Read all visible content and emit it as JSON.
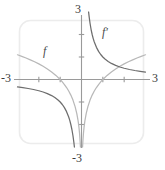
{
  "chart_data": {
    "type": "line",
    "title": "",
    "xlabel": "",
    "ylabel": "",
    "xlim": [
      -3,
      3
    ],
    "ylim": [
      -3,
      3
    ],
    "grid": false,
    "legend_position": "inline-annotation",
    "x_tick_labels": [
      "-3",
      "3"
    ],
    "y_tick_labels": [
      "3",
      "-3"
    ],
    "x_ticks": [
      -2,
      -1,
      1,
      2
    ],
    "y_ticks": [
      -2,
      -1,
      1,
      2
    ],
    "annotations": [
      {
        "text": "f",
        "x": -1.55,
        "y": 1.55
      },
      {
        "text": "f′",
        "x": 0.85,
        "y": 2.35
      }
    ],
    "series": [
      {
        "name": "f",
        "label": "f",
        "color": "#b8b8b8",
        "formula": "ln|x|",
        "points_negative": [
          [
            -3.0,
            1.099
          ],
          [
            -2.8,
            1.03
          ],
          [
            -2.6,
            0.956
          ],
          [
            -2.4,
            0.875
          ],
          [
            -2.2,
            0.788
          ],
          [
            -2.0,
            0.693
          ],
          [
            -1.8,
            0.588
          ],
          [
            -1.6,
            0.47
          ],
          [
            -1.4,
            0.336
          ],
          [
            -1.2,
            0.182
          ],
          [
            -1.0,
            0.0
          ],
          [
            -0.9,
            -0.105
          ],
          [
            -0.8,
            -0.223
          ],
          [
            -0.7,
            -0.357
          ],
          [
            -0.6,
            -0.511
          ],
          [
            -0.5,
            -0.693
          ],
          [
            -0.4,
            -0.916
          ],
          [
            -0.3,
            -1.204
          ],
          [
            -0.22,
            -1.514
          ],
          [
            -0.16,
            -1.833
          ],
          [
            -0.12,
            -2.12
          ],
          [
            -0.09,
            -2.408
          ],
          [
            -0.06,
            -2.813
          ],
          [
            -0.05,
            -3.0
          ]
        ],
        "points_positive": [
          [
            0.05,
            -3.0
          ],
          [
            0.06,
            -2.813
          ],
          [
            0.09,
            -2.408
          ],
          [
            0.12,
            -2.12
          ],
          [
            0.16,
            -1.833
          ],
          [
            0.22,
            -1.514
          ],
          [
            0.3,
            -1.204
          ],
          [
            0.4,
            -0.916
          ],
          [
            0.5,
            -0.693
          ],
          [
            0.6,
            -0.511
          ],
          [
            0.7,
            -0.357
          ],
          [
            0.8,
            -0.223
          ],
          [
            0.9,
            -0.105
          ],
          [
            1.0,
            0.0
          ],
          [
            1.2,
            0.182
          ],
          [
            1.4,
            0.336
          ],
          [
            1.6,
            0.47
          ],
          [
            1.8,
            0.588
          ],
          [
            2.0,
            0.693
          ],
          [
            2.2,
            0.788
          ],
          [
            2.4,
            0.875
          ],
          [
            2.6,
            0.956
          ],
          [
            2.8,
            1.03
          ],
          [
            3.0,
            1.099
          ]
        ]
      },
      {
        "name": "f-prime",
        "label": "f′",
        "color": "#6d6d6d",
        "formula": "1/x",
        "points_negative": [
          [
            -3.0,
            -0.333
          ],
          [
            -2.75,
            -0.364
          ],
          [
            -2.5,
            -0.4
          ],
          [
            -2.25,
            -0.444
          ],
          [
            -2.0,
            -0.5
          ],
          [
            -1.8,
            -0.556
          ],
          [
            -1.6,
            -0.625
          ],
          [
            -1.4,
            -0.714
          ],
          [
            -1.25,
            -0.8
          ],
          [
            -1.1,
            -0.909
          ],
          [
            -1.0,
            -1.0
          ],
          [
            -0.9,
            -1.111
          ],
          [
            -0.8,
            -1.25
          ],
          [
            -0.7,
            -1.429
          ],
          [
            -0.6,
            -1.667
          ],
          [
            -0.55,
            -1.818
          ],
          [
            -0.5,
            -2.0
          ],
          [
            -0.45,
            -2.222
          ],
          [
            -0.4,
            -2.5
          ],
          [
            -0.36,
            -2.778
          ],
          [
            -0.333,
            -3.0
          ]
        ],
        "points_positive": [
          [
            0.333,
            3.0
          ],
          [
            0.36,
            2.778
          ],
          [
            0.4,
            2.5
          ],
          [
            0.45,
            2.222
          ],
          [
            0.5,
            2.0
          ],
          [
            0.55,
            1.818
          ],
          [
            0.6,
            1.667
          ],
          [
            0.7,
            1.429
          ],
          [
            0.8,
            1.25
          ],
          [
            0.9,
            1.111
          ],
          [
            1.0,
            1.0
          ],
          [
            1.1,
            0.909
          ],
          [
            1.25,
            0.8
          ],
          [
            1.4,
            0.714
          ],
          [
            1.6,
            0.625
          ],
          [
            1.8,
            0.556
          ],
          [
            2.0,
            0.5
          ],
          [
            2.25,
            0.444
          ],
          [
            2.5,
            0.4
          ],
          [
            2.75,
            0.364
          ],
          [
            3.0,
            0.333
          ]
        ]
      }
    ]
  },
  "labels": {
    "y_max": "3",
    "y_min": "-3",
    "x_min": "-3",
    "x_max": "3",
    "curve_f": "f",
    "curve_f_prime": "f′"
  },
  "colors": {
    "axis": "#9a9a9a",
    "frame": "#ebebeb",
    "curve_f": "#b8b8b8",
    "curve_f_prime": "#6d6d6d",
    "text": "#3a3a3a"
  }
}
